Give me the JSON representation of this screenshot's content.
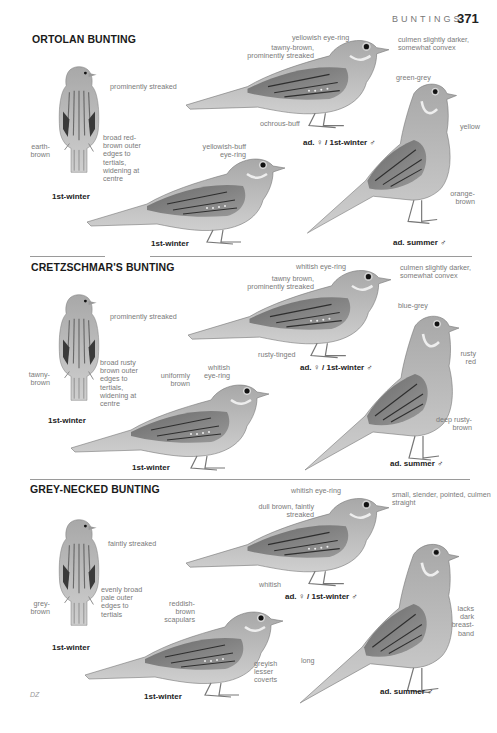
{
  "header": {
    "running_head": "BUNTINGS",
    "page_number": "371"
  },
  "footer": {
    "artist_signature": "DZ"
  },
  "colors": {
    "ink": "#1a1a1a",
    "label_grey": "#7a7a7a",
    "bird_light": "#c9c9c9",
    "bird_mid": "#9d9d9d",
    "bird_dark": "#4a4a4a",
    "rule": "#9a9a9a",
    "paper": "#ffffff"
  },
  "species": [
    {
      "name": "ORTOLAN BUNTING",
      "figures": [
        {
          "caption": "1st-winter",
          "view": "back",
          "labels": [
            "prominently streaked",
            "earth-brown",
            "broad red-brown outer edges to tertials, widening at centre"
          ]
        },
        {
          "caption": "ad. ♀ / 1st-winter ♂",
          "view": "side",
          "labels": [
            "yellowish eye-ring",
            "tawny-brown, prominently streaked",
            "culmen slightly darker, somewhat convex",
            "ochrous-buff"
          ]
        },
        {
          "caption": "1st-winter",
          "view": "side",
          "labels": [
            "yellowish-buff eye-ring"
          ]
        },
        {
          "caption": "ad. summer ♂",
          "view": "upright",
          "labels": [
            "green-grey",
            "yellow",
            "orange-brown"
          ]
        }
      ]
    },
    {
      "name": "CRETZSCHMAR'S BUNTING",
      "figures": [
        {
          "caption": "1st-winter",
          "view": "back",
          "labels": [
            "prominently streaked",
            "tawny-brown",
            "broad rusty brown outer edges to tertials, widening at centre"
          ]
        },
        {
          "caption": "ad. ♀ / 1st-winter ♂",
          "view": "side",
          "labels": [
            "whitish eye-ring",
            "tawny brown, prominently streaked",
            "culmen slightly darker, somewhat convex",
            "rusty-tinged"
          ]
        },
        {
          "caption": "1st-winter",
          "view": "side",
          "labels": [
            "uniformly brown",
            "whitish eye-ring"
          ]
        },
        {
          "caption": "ad. summer ♂",
          "view": "upright",
          "labels": [
            "blue-grey",
            "rusty red",
            "deep rusty-brown"
          ]
        }
      ]
    },
    {
      "name": "GREY-NECKED BUNTING",
      "figures": [
        {
          "caption": "1st-winter",
          "view": "back",
          "labels": [
            "faintly streaked",
            "grey-brown",
            "evenly broad pale outer edges to tertials"
          ]
        },
        {
          "caption": "ad. ♀ / 1st-winter ♂",
          "view": "side",
          "labels": [
            "whitish eye-ring",
            "dull brown, faintly streaked",
            "small, slender, pointed, culmen straight",
            "whitish"
          ]
        },
        {
          "caption": "1st-winter",
          "view": "side",
          "labels": [
            "reddish-brown scapulars",
            "greyish lesser coverts"
          ]
        },
        {
          "caption": "ad. summer ♂",
          "view": "upright",
          "labels": [
            "lacks dark breast-band",
            "long"
          ]
        }
      ]
    }
  ]
}
